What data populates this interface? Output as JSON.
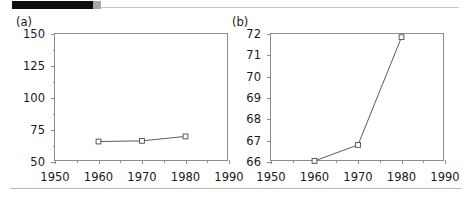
{
  "header": {
    "redaction_bar": "",
    "redaction_bar_color": "#100f10",
    "accent_gray": "#a9a9a9",
    "rule_color": "#c8c8c8"
  },
  "footer": {
    "rule_color": "#b9b9b9"
  },
  "chart_data": [
    {
      "type": "line",
      "panel": "(a)",
      "title": "",
      "xlabel": "",
      "ylabel": "",
      "x": [
        1960,
        1970,
        1980
      ],
      "values": [
        66,
        66.5,
        70
      ],
      "categories": [
        "1960",
        "1970",
        "1980"
      ],
      "xlim": [
        1950,
        1990
      ],
      "ylim": [
        50,
        150
      ],
      "xticks": [
        1950,
        1960,
        1970,
        1980,
        1990
      ],
      "xticklabels": [
        "1950",
        "1960",
        "1970",
        "1980",
        "1990"
      ],
      "xminorticks": [
        1955,
        1965,
        1975,
        1985
      ],
      "yticks": [
        50,
        75,
        100,
        125,
        150
      ],
      "yticklabels": [
        "50",
        "75",
        "100",
        "125",
        "150"
      ],
      "yminorticks": [
        62.5,
        87.5,
        112.5,
        137.5
      ],
      "grid": false,
      "legend": "none",
      "marker": "open-square",
      "line_color": "#4a4a4a",
      "marker_face": "#ffffff",
      "axis_color": "#8c8c8c"
    },
    {
      "type": "line",
      "panel": "(b)",
      "title": "",
      "xlabel": "",
      "ylabel": "",
      "x": [
        1960,
        1970,
        1980
      ],
      "values": [
        66.05,
        66.8,
        71.85
      ],
      "categories": [
        "1960",
        "1970",
        "1980"
      ],
      "xlim": [
        1950,
        1990
      ],
      "ylim": [
        66,
        72
      ],
      "xticks": [
        1950,
        1960,
        1970,
        1980,
        1990
      ],
      "xticklabels": [
        "1950",
        "1960",
        "1970",
        "1980",
        "1990"
      ],
      "xminorticks": [
        1955,
        1965,
        1975,
        1985
      ],
      "yticks": [
        66,
        67,
        68,
        69,
        70,
        71,
        72
      ],
      "yticklabels": [
        "66",
        "67",
        "68",
        "69",
        "70",
        "71",
        "72"
      ],
      "yminorticks": [],
      "grid": false,
      "legend": "none",
      "marker": "open-square",
      "line_color": "#4a4a4a",
      "marker_face": "#ffffff",
      "axis_color": "#8c8c8c"
    }
  ]
}
